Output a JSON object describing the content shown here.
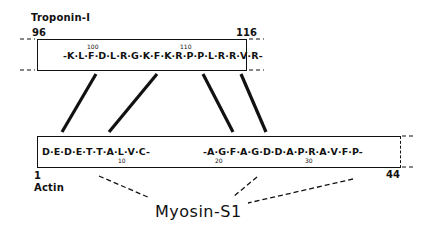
{
  "troponin": {
    "label": "Troponin-I",
    "start": "96",
    "end": "116",
    "sequence": "-K·L·F·D·L·R·G·K·F·K·R·P·P·L·R·R·V·R-",
    "ticks": [
      "100",
      "110"
    ]
  },
  "actin": {
    "label": "Actin",
    "start": "1",
    "end": "44",
    "sequence_left": "D·E·D·E·T·T·A·L·V·C-",
    "sequence_right": "-A·G·F·A·G·D·D·A·P·R·A·V·F·P-",
    "ticks": [
      "10",
      "20",
      "30"
    ]
  },
  "myosin": {
    "label": "Myosin-S1"
  }
}
